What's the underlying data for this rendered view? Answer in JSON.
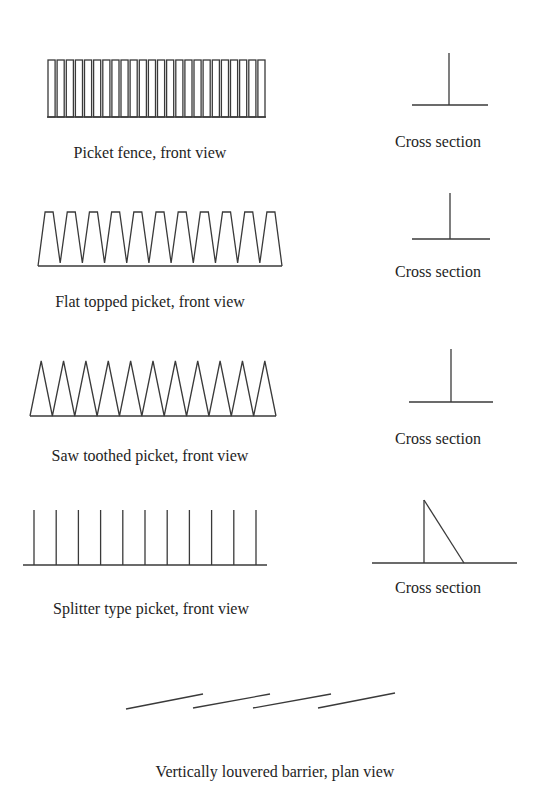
{
  "colors": {
    "background": "#ffffff",
    "stroke": "#3a3a3a",
    "text": "#1e1e1e"
  },
  "rows": [
    {
      "id": "picket-fence",
      "front_view_label": "Picket fence, front view",
      "cross_section_label": "Cross section",
      "front_view": {
        "type": "rect-pickets",
        "x_start": 47,
        "x_end": 266,
        "y_top": 60,
        "y_bottom": 117,
        "count": 24
      },
      "cross_section": {
        "type": "t-section",
        "stem_x": 449,
        "stem_top": 53,
        "base_y": 105,
        "base_x1": 412,
        "base_x2": 488
      }
    },
    {
      "id": "flat-topped-picket",
      "front_view_label": "Flat topped picket, front view",
      "cross_section_label": "Cross section",
      "front_view": {
        "type": "flat-topped",
        "x_start": 38,
        "x_end": 282,
        "y_top": 212,
        "y_valley": 263,
        "y_base": 266,
        "count": 11
      },
      "cross_section": {
        "type": "t-section",
        "stem_x": 450,
        "stem_top": 193,
        "base_y": 239,
        "base_x1": 412,
        "base_x2": 490
      }
    },
    {
      "id": "saw-toothed-picket",
      "front_view_label": "Saw toothed picket, front view",
      "cross_section_label": "Cross section",
      "front_view": {
        "type": "saw-toothed",
        "x_start": 30,
        "x_end": 276,
        "y_top": 361,
        "y_base": 416,
        "count": 11
      },
      "cross_section": {
        "type": "t-section",
        "stem_x": 451,
        "stem_top": 349,
        "base_y": 402,
        "base_x1": 409,
        "base_x2": 493
      }
    },
    {
      "id": "splitter-type-picket",
      "front_view_label": "Splitter type picket, front view",
      "cross_section_label": "Cross section",
      "front_view": {
        "type": "splitter",
        "x_first": 34,
        "spacing": 22.2,
        "y_top": 510,
        "y_base": 565,
        "base_x1": 23,
        "base_x2": 267,
        "count": 11
      },
      "cross_section": {
        "type": "triangle-section",
        "stem_x": 424,
        "stem_top": 500,
        "foot_x": 464,
        "base_y": 563,
        "base_x1": 372,
        "base_x2": 517
      }
    }
  ],
  "louvered": {
    "label": "Vertically louvered barrier, plan view",
    "slats": [
      {
        "x1": 126,
        "y1": 709,
        "x2": 203,
        "y2": 694
      },
      {
        "x1": 193,
        "y1": 708,
        "x2": 270,
        "y2": 694
      },
      {
        "x1": 253,
        "y1": 708,
        "x2": 331,
        "y2": 694
      },
      {
        "x1": 318,
        "y1": 708,
        "x2": 395,
        "y2": 693
      }
    ]
  },
  "label_positions": {
    "picket-fence": {
      "front": [
        150,
        153
      ],
      "cross": [
        438,
        142
      ]
    },
    "flat-topped-picket": {
      "front": [
        150,
        302
      ],
      "cross": [
        438,
        272
      ]
    },
    "saw-toothed-picket": {
      "front": [
        150,
        456
      ],
      "cross": [
        438,
        439
      ]
    },
    "splitter-type-picket": {
      "front": [
        151,
        609
      ],
      "cross": [
        438,
        588
      ]
    },
    "louvered": [
      275,
      772
    ]
  }
}
